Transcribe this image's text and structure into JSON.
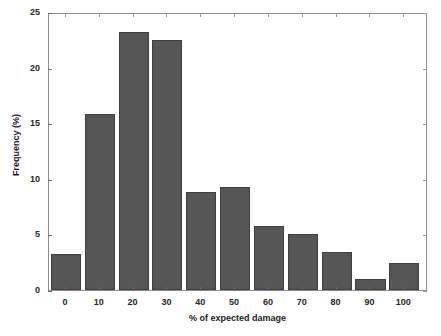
{
  "chart_data": {
    "type": "bar",
    "title": "",
    "xlabel": "% of expected damage",
    "ylabel": "Frequency (%)",
    "categories": [
      "0",
      "10",
      "20",
      "30",
      "40",
      "50",
      "60",
      "70",
      "80",
      "90",
      "100"
    ],
    "values": [
      3.2,
      15.8,
      23.2,
      22.5,
      8.8,
      9.3,
      5.8,
      5.0,
      3.4,
      1.0,
      2.4
    ],
    "series": [
      {
        "name": "Frequency",
        "values": [
          3.2,
          15.8,
          23.2,
          22.5,
          8.8,
          9.3,
          5.8,
          5.0,
          3.4,
          1.0,
          2.4
        ]
      }
    ],
    "xlim": [
      -5,
      107
    ],
    "ylim": [
      0,
      25
    ],
    "ytick_labels": [
      "0",
      "5",
      "10",
      "15",
      "20",
      "25"
    ],
    "ytick_values": [
      0,
      5,
      10,
      15,
      20,
      25
    ],
    "xtick_labels": [
      "0",
      "10",
      "20",
      "30",
      "40",
      "50",
      "60",
      "70",
      "80",
      "90",
      "100"
    ],
    "xtick_values": [
      0,
      10,
      20,
      30,
      40,
      50,
      60,
      70,
      80,
      90,
      100
    ],
    "grid": false,
    "legend": null,
    "bar_color": "#565656",
    "bar_edge_color": "#3f3f3f",
    "axis_color": "#8d8d8d",
    "background_color": "#ffffff",
    "text_color": "#262626",
    "bar_width": 8.9
  }
}
